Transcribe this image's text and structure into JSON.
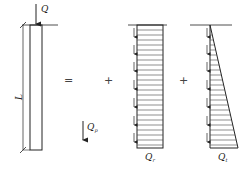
{
  "diagram": {
    "pile": {
      "load_label": "Q",
      "length_label": "L"
    },
    "operators": {
      "equals": "=",
      "plus1": "+",
      "plus2": "+"
    },
    "tip_resistance": {
      "label": "Q",
      "subscript": "p"
    },
    "uniform_friction": {
      "label": "Q",
      "subscript": "r"
    },
    "triangular_friction": {
      "label": "Q",
      "subscript": "t"
    },
    "colors": {
      "line": "#222222",
      "background": "#ffffff"
    }
  }
}
